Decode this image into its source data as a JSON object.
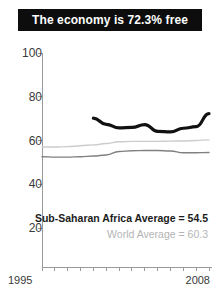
{
  "title": {
    "text": "The economy is 72.3% free"
  },
  "annotations": {
    "regional_average": "Sub-Saharan Africa Average = 54.5",
    "world_average": "World Average = 60.3"
  },
  "axis": {
    "x_start_label": "1995",
    "x_end_label": "2008",
    "y_labels": [
      "100",
      "80",
      "60",
      "40",
      "20"
    ]
  },
  "colors": {
    "banner_background": "#0d0d0d",
    "banner_text": "#ffffff",
    "country_line": "#111111",
    "regional_line": "#808080",
    "world_line": "#cccccc",
    "axis": "#9a9a9a",
    "tick_text": "#3a3a3a",
    "annotation_primary": "#1c1c1c",
    "annotation_secondary": "#b4b4b4"
  },
  "chart_data": {
    "type": "line",
    "title": "The economy is 72.3% free",
    "xlabel": "",
    "ylabel": "",
    "xlim": [
      1995,
      2008
    ],
    "ylim": [
      0,
      100
    ],
    "yticks": [
      20,
      40,
      60,
      80,
      100
    ],
    "xticks": [
      1995,
      1996,
      1997,
      1998,
      1999,
      2000,
      2001,
      2002,
      2003,
      2004,
      2005,
      2006,
      2007,
      2008
    ],
    "grid": false,
    "legend_position": "none",
    "x": [
      1995,
      1996,
      1997,
      1998,
      1999,
      2000,
      2001,
      2002,
      2003,
      2004,
      2005,
      2006,
      2007,
      2008
    ],
    "series": [
      {
        "name": "Country economic freedom",
        "color": "#111111",
        "width": 3.2,
        "values": [
          null,
          null,
          null,
          null,
          70.2,
          67.4,
          65.8,
          66.0,
          67.3,
          64.2,
          63.9,
          65.6,
          66.3,
          72.3
        ]
      },
      {
        "name": "World Average",
        "color": "#cccccc",
        "width": 1.4,
        "values": [
          57.0,
          57.0,
          57.2,
          57.6,
          58.0,
          58.6,
          59.4,
          59.6,
          59.6,
          59.6,
          59.7,
          59.8,
          60.0,
          60.3
        ]
      },
      {
        "name": "Sub-Saharan Africa Average",
        "color": "#808080",
        "width": 1.4,
        "values": [
          52.6,
          52.4,
          52.4,
          52.6,
          52.9,
          53.4,
          55.0,
          55.3,
          55.4,
          55.4,
          55.2,
          54.4,
          54.4,
          54.5
        ]
      }
    ],
    "annotations": [
      {
        "text": "Sub-Saharan Africa Average = 54.5",
        "color": "#1c1c1c"
      },
      {
        "text": "World Average = 60.3",
        "color": "#b4b4b4"
      }
    ]
  }
}
